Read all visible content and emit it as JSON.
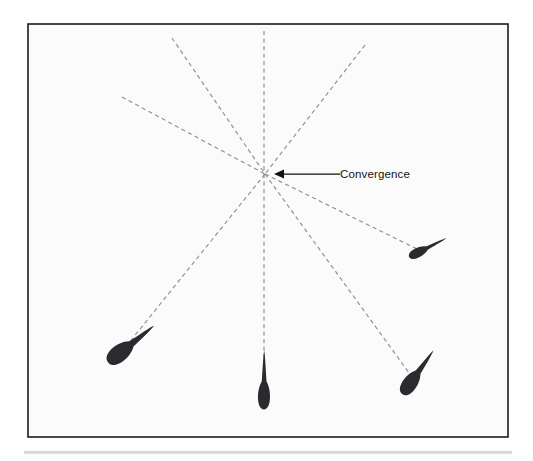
{
  "figure": {
    "background_color": "#ffffff",
    "panel": {
      "x": 28,
      "y": 24,
      "width": 480,
      "height": 413,
      "fill": "#fbfbfb",
      "border_color": "#1b1b1b"
    },
    "convergence_point": {
      "x": 265,
      "y": 174
    },
    "ray_color": "#8f8f93",
    "marker_color": "#2b2b2f",
    "rays": [
      {
        "name": "ray-up-vertical",
        "x1": 264,
        "y1": 31,
        "x2": 264,
        "y2": 174
      },
      {
        "name": "ray-down-vertical",
        "x1": 264,
        "y1": 174,
        "x2": 264,
        "y2": 392
      },
      {
        "name": "ray-upper-left-steep",
        "x1": 172,
        "y1": 38,
        "x2": 265,
        "y2": 174
      },
      {
        "name": "ray-upper-left-shallow",
        "x1": 122,
        "y1": 97,
        "x2": 265,
        "y2": 174
      },
      {
        "name": "ray-upper-right",
        "x1": 365,
        "y1": 45,
        "x2": 265,
        "y2": 174
      },
      {
        "name": "ray-lower-left",
        "x1": 265,
        "y1": 174,
        "x2": 124,
        "y2": 349
      },
      {
        "name": "ray-lower-right-shallow",
        "x1": 265,
        "y1": 174,
        "x2": 419,
        "y2": 250
      },
      {
        "name": "ray-lower-right-steep",
        "x1": 265,
        "y1": 174,
        "x2": 412,
        "y2": 377
      }
    ],
    "markers": [
      {
        "name": "marker-lower-left",
        "bulb_x": 121,
        "bulb_y": 352,
        "bulb_rx": 10.5,
        "bulb_ry": 16.5,
        "angle_deg": 231,
        "tail_length": 26,
        "scale": 1.0
      },
      {
        "name": "marker-bottom-center",
        "bulb_x": 264,
        "bulb_y": 394,
        "bulb_rx": 7.5,
        "bulb_ry": 15.5,
        "angle_deg": 180,
        "tail_length": 28,
        "scale": 1.0
      },
      {
        "name": "marker-bottom-right",
        "bulb_x": 411,
        "bulb_y": 382,
        "bulb_rx": 9.0,
        "bulb_ry": 15.0,
        "angle_deg": 215,
        "tail_length": 24,
        "scale": 1.0
      },
      {
        "name": "marker-right-middle",
        "bulb_x": 419,
        "bulb_y": 252,
        "bulb_rx": 6.0,
        "bulb_ry": 11.0,
        "angle_deg": 243,
        "tail_length": 20,
        "scale": 1.0
      }
    ],
    "annotation": {
      "label": "Convergence",
      "text_x": 340,
      "text_y": 178,
      "leader_from_x": 340,
      "leader_to_x": 283,
      "leader_y": 174,
      "arrow_direction": "left",
      "color": "#131313"
    },
    "footer_rule": {
      "x1": 24,
      "x2": 512,
      "y": 452,
      "color": "#c9c9c9"
    }
  }
}
